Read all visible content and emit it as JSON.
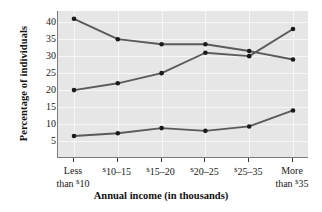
{
  "chart_data": {
    "type": "line",
    "title": "",
    "xlabel": "Annual income (in thousands)",
    "ylabel": "Percentage of individuals",
    "categories": [
      "Less than $10",
      "$10–15",
      "$15–20",
      "$20–25",
      "$25–35",
      "More than $35"
    ],
    "ylim": [
      0,
      43
    ],
    "yticks": [
      5,
      10,
      15,
      20,
      25,
      30,
      35,
      40
    ],
    "grid": true,
    "legend": "none",
    "series": [
      {
        "name": "series-1",
        "values": [
          41.0,
          35.0,
          33.5,
          33.5,
          31.5,
          29.0
        ]
      },
      {
        "name": "series-2",
        "values": [
          20.0,
          22.0,
          25.0,
          31.0,
          30.0,
          38.0
        ]
      },
      {
        "name": "series-3",
        "values": [
          6.5,
          7.3,
          8.8,
          8.0,
          9.3,
          14.0
        ]
      }
    ],
    "series_color": "#5a5a5a",
    "marker_color": "#1a1a1a",
    "plot_background": "#e6e6e6",
    "grid_color": "#f7f7f7",
    "axis_color": "#7a7a7a"
  },
  "xaxis": {
    "labels": [
      {
        "line1": "Less",
        "line2_pre": "than ",
        "line2_sup": "$",
        "line2_post": "10"
      },
      {
        "line1_sup": "$",
        "line1": "10–15",
        "line2_pre": "",
        "line2_sup": "",
        "line2_post": ""
      },
      {
        "line1_sup": "$",
        "line1": "15–20",
        "line2_pre": "",
        "line2_sup": "",
        "line2_post": ""
      },
      {
        "line1_sup": "$",
        "line1": "20–25",
        "line2_pre": "",
        "line2_sup": "",
        "line2_post": ""
      },
      {
        "line1_sup": "$",
        "line1": "25–35",
        "line2_pre": "",
        "line2_sup": "",
        "line2_post": ""
      },
      {
        "line1": "More",
        "line2_pre": "than ",
        "line2_sup": "$",
        "line2_post": "35"
      }
    ],
    "title": "Annual income (in thousands)"
  },
  "yaxis": {
    "title": "Percentage of individuals",
    "ticks": [
      "40",
      "35",
      "30",
      "25",
      "20",
      "15",
      "10",
      "5"
    ]
  }
}
